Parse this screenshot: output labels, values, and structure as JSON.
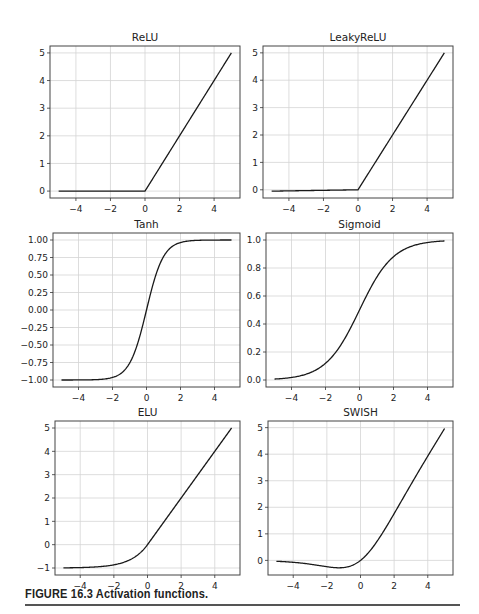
{
  "caption": "FIGURE 16.3 Activation functions.",
  "chart_data": [
    {
      "type": "line",
      "title": "ReLU",
      "xlim": [
        -5.5,
        5.5
      ],
      "ylim": [
        -0.25,
        5.25
      ],
      "xticks": [
        -4,
        -2,
        0,
        2,
        4
      ],
      "yticks": [
        0,
        1,
        2,
        3,
        4,
        5
      ],
      "yticklabels": [
        "0",
        "1",
        "2",
        "3",
        "4",
        "5"
      ],
      "grid": true,
      "fn": "relu",
      "x": [
        -5,
        0,
        5
      ],
      "y": [
        0,
        0,
        5
      ],
      "box": {
        "x": 50,
        "y": 46,
        "w": 190,
        "h": 152
      }
    },
    {
      "type": "line",
      "title": "LeakyReLU",
      "xlim": [
        -5.5,
        5.5
      ],
      "ylim": [
        -0.3,
        5.25
      ],
      "xticks": [
        -4,
        -2,
        0,
        2,
        4
      ],
      "yticks": [
        0,
        1,
        2,
        3,
        4,
        5
      ],
      "yticklabels": [
        "0",
        "1",
        "2",
        "3",
        "4",
        "5"
      ],
      "grid": true,
      "fn": "leaky",
      "x": [
        -5,
        0,
        5
      ],
      "y": [
        -0.05,
        0,
        5
      ],
      "box": {
        "x": 263,
        "y": 46,
        "w": 190,
        "h": 152
      }
    },
    {
      "type": "line",
      "title": "Tanh",
      "xlim": [
        -5.5,
        5.5
      ],
      "ylim": [
        -1.1,
        1.1
      ],
      "xticks": [
        -4,
        -2,
        0,
        2,
        4
      ],
      "yticks": [
        1,
        0.75,
        0.5,
        0.25,
        0,
        -0.25,
        -0.5,
        -0.75,
        -1
      ],
      "yticklabels": [
        "1.00",
        "0.75",
        "0.50",
        "0.25",
        "0.00",
        "−0.25",
        "−0.50",
        "−0.75",
        "−1.00"
      ],
      "grid": true,
      "fn": "tanh",
      "x": [
        -5,
        -2,
        -1,
        0,
        1,
        2,
        5
      ],
      "y": [
        -1.0,
        -0.96,
        -0.76,
        0,
        0.76,
        0.96,
        1.0
      ],
      "box": {
        "x": 53,
        "y": 233,
        "w": 187,
        "h": 154
      }
    },
    {
      "type": "line",
      "title": "Sigmoid",
      "xlim": [
        -5.5,
        5.5
      ],
      "ylim": [
        -0.05,
        1.05
      ],
      "xticks": [
        -4,
        -2,
        0,
        2,
        4
      ],
      "yticks": [
        0,
        0.2,
        0.4,
        0.6,
        0.8,
        1.0
      ],
      "yticklabels": [
        "0.0",
        "0.2",
        "0.4",
        "0.6",
        "0.8",
        "1.0"
      ],
      "grid": true,
      "fn": "sigmoid",
      "x": [
        -5,
        -2,
        0,
        2,
        5
      ],
      "y": [
        0.007,
        0.12,
        0.5,
        0.88,
        0.993
      ],
      "box": {
        "x": 266,
        "y": 233,
        "w": 187,
        "h": 154
      }
    },
    {
      "type": "line",
      "title": "ELU",
      "xlim": [
        -5.5,
        5.5
      ],
      "ylim": [
        -1.3,
        5.3
      ],
      "xticks": [
        -4,
        -2,
        0,
        2,
        4
      ],
      "yticks": [
        -1,
        0,
        1,
        2,
        3,
        4,
        5
      ],
      "yticklabels": [
        "−1",
        "0",
        "1",
        "2",
        "3",
        "4",
        "5"
      ],
      "grid": true,
      "fn": "elu",
      "x": [
        -5,
        -2,
        -1,
        0,
        2,
        5
      ],
      "y": [
        -0.99,
        -0.86,
        -0.63,
        0,
        2,
        5
      ],
      "box": {
        "x": 55,
        "y": 421,
        "w": 185,
        "h": 154
      }
    },
    {
      "type": "line",
      "title": "SWISH",
      "xlim": [
        -5.5,
        5.5
      ],
      "ylim": [
        -0.55,
        5.25
      ],
      "xticks": [
        -4,
        -2,
        0,
        2,
        4
      ],
      "yticks": [
        0,
        1,
        2,
        3,
        4,
        5
      ],
      "yticklabels": [
        "0",
        "1",
        "2",
        "3",
        "4",
        "5"
      ],
      "grid": true,
      "fn": "swish",
      "x": [
        -5,
        -1.28,
        0,
        2,
        5
      ],
      "y": [
        -0.03,
        -0.28,
        0,
        1.76,
        4.97
      ],
      "box": {
        "x": 268,
        "y": 421,
        "w": 185,
        "h": 154
      }
    }
  ]
}
